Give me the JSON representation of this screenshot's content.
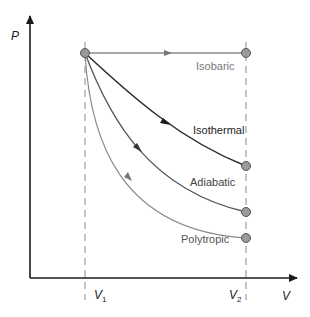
{
  "diagram": {
    "axes": {
      "y_label": "P",
      "x_label": "V",
      "v1_label": "V",
      "v1_sub": "1",
      "v2_label": "V",
      "v2_sub": "2"
    },
    "processes": [
      {
        "name": "Isobaric",
        "label": "Isobaric",
        "color": "#8a8a8a"
      },
      {
        "name": "Isothermal",
        "label": "Isothermal",
        "color": "#2a2a2a"
      },
      {
        "name": "Adiabatic",
        "label": "Adiabatic",
        "color": "#555555"
      },
      {
        "name": "Polytropic",
        "label": "Polytropic",
        "color": "#8a8a8a"
      }
    ],
    "colors": {
      "axis": "#1a1a1a",
      "dashed": "#888888",
      "point_fill": "#9a9a9a",
      "point_stroke": "#555555",
      "label_gray": "#7a7a7a",
      "label_dark": "#222222",
      "label_mid": "#444444"
    }
  }
}
